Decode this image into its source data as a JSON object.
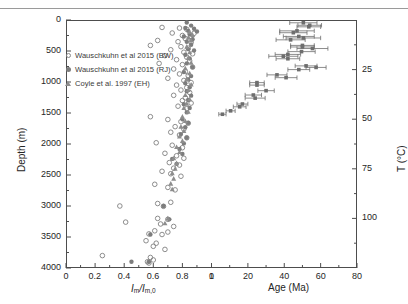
{
  "figure": {
    "background": "#ffffff",
    "frame_color": "#4d4d4d",
    "marker_color": "#808080",
    "errorbar_color": "#6e6e6e"
  },
  "legend": {
    "entries": [
      {
        "marker": "open-circle",
        "label": "Wauschkuhn et al 2015 (BW)"
      },
      {
        "marker": "filled-circle",
        "label": "Wauschkuhn et al 2015 (RJ)"
      },
      {
        "marker": "filled-triangle",
        "label": "Coyle et al. 1997 (EH)"
      }
    ]
  },
  "axes": {
    "left": {
      "label": "Depth (m)",
      "ticks": [
        0,
        500,
        1000,
        1500,
        2000,
        2500,
        3000,
        3500,
        4000
      ],
      "lim": [
        0,
        4000
      ],
      "inverted": true
    },
    "bottom_left": {
      "label_html": "Im/Im,0",
      "ticks": [
        0,
        0.2,
        0.4,
        0.6,
        0.8,
        1
      ],
      "tick_labels": [
        "0",
        "0.2",
        "0.4",
        "0.6",
        "0.8",
        "1"
      ],
      "lim": [
        0,
        1
      ]
    },
    "bottom_right": {
      "label": "Age (Ma)",
      "ticks": [
        0,
        20,
        40,
        60,
        80
      ],
      "tick_labels": [
        "0",
        "20",
        "40",
        "60",
        "80"
      ],
      "lim": [
        0,
        80
      ]
    },
    "right": {
      "label": "T (°C)",
      "ticks": [
        25,
        50,
        75,
        100
      ],
      "tick_labels": [
        "25",
        "50",
        "75",
        "100"
      ],
      "lim": [
        0,
        125
      ]
    }
  },
  "chart_data": {
    "type": "scatter",
    "title": "",
    "xlabel": "Im/Im,0 and Age (Ma)",
    "ylabel": "Depth (m)",
    "ylim": [
      0,
      4000
    ],
    "y_inverted": true,
    "grid": false,
    "legend_position": "upper-left",
    "panels": [
      {
        "name": "track-length-ratio",
        "xlabel": "Im/Im,0",
        "xlim": [
          0,
          1
        ],
        "series": [
          {
            "name": "Wauschkuhn et al 2015 (BW)",
            "marker": "open-circle",
            "color": "#808080",
            "points": [
              [
                0.66,
                120
              ],
              [
                0.78,
                130
              ],
              [
                0.83,
                150
              ],
              [
                0.73,
                210
              ],
              [
                0.88,
                215
              ],
              [
                0.8,
                250
              ],
              [
                0.86,
                265
              ],
              [
                0.82,
                300
              ],
              [
                0.63,
                330
              ],
              [
                0.77,
                350
              ],
              [
                0.86,
                360
              ],
              [
                0.58,
                410
              ],
              [
                0.79,
                430
              ],
              [
                0.84,
                455
              ],
              [
                0.72,
                480
              ],
              [
                0.81,
                520
              ],
              [
                0.87,
                545
              ],
              [
                0.68,
                575
              ],
              [
                0.83,
                600
              ],
              [
                0.76,
                640
              ],
              [
                0.85,
                660
              ],
              [
                0.64,
                700
              ],
              [
                0.8,
                720
              ],
              [
                0.87,
                760
              ],
              [
                0.74,
                790
              ],
              [
                0.82,
                830
              ],
              [
                0.78,
                870
              ],
              [
                0.84,
                900
              ],
              [
                0.7,
                940
              ],
              [
                0.81,
                975
              ],
              [
                0.86,
                1010
              ],
              [
                0.76,
                1050
              ],
              [
                0.83,
                1090
              ],
              [
                0.79,
                1130
              ],
              [
                0.85,
                1170
              ],
              [
                0.74,
                1215
              ],
              [
                0.82,
                1255
              ],
              [
                0.8,
                1300
              ],
              [
                0.86,
                1340
              ],
              [
                0.77,
                1390
              ],
              [
                0.83,
                1430
              ],
              [
                0.58,
                1560
              ],
              [
                0.7,
                1605
              ],
              [
                0.79,
                1640
              ],
              [
                0.84,
                1665
              ],
              [
                0.75,
                1720
              ],
              [
                0.81,
                1760
              ],
              [
                0.72,
                1810
              ],
              [
                0.78,
                1855
              ],
              [
                0.83,
                1900
              ],
              [
                0.62,
                1980
              ],
              [
                0.73,
                2020
              ],
              [
                0.8,
                2060
              ],
              [
                0.68,
                2150
              ],
              [
                0.76,
                2190
              ],
              [
                0.81,
                2230
              ],
              [
                0.71,
                2300
              ],
              [
                0.78,
                2340
              ],
              [
                0.74,
                2390
              ],
              [
                0.66,
                2440
              ],
              [
                0.72,
                2480
              ],
              [
                0.79,
                2520
              ],
              [
                0.61,
                2650
              ],
              [
                0.7,
                2700
              ],
              [
                0.75,
                2740
              ],
              [
                0.37,
                3000
              ],
              [
                0.63,
                2960
              ],
              [
                0.72,
                2940
              ],
              [
                0.67,
                3005
              ],
              [
                0.41,
                3260
              ],
              [
                0.63,
                3200
              ],
              [
                0.7,
                3215
              ],
              [
                0.65,
                3290
              ],
              [
                0.74,
                3330
              ],
              [
                0.61,
                3400
              ],
              [
                0.57,
                3450
              ],
              [
                0.66,
                3460
              ],
              [
                0.7,
                3420
              ],
              [
                0.55,
                3560
              ],
              [
                0.62,
                3600
              ],
              [
                0.6,
                3650
              ],
              [
                0.68,
                3700
              ],
              [
                0.25,
                3800
              ],
              [
                0.58,
                3830
              ],
              [
                0.56,
                3900
              ],
              [
                0.57,
                3920
              ],
              [
                0.6,
                3870
              ]
            ]
          },
          {
            "name": "Wauschkuhn et al 2015 (RJ)",
            "marker": "filled-circle",
            "color": "#7d7d7d",
            "points": [
              [
                0.83,
                40
              ],
              [
                0.86,
                90
              ],
              [
                0.82,
                130
              ],
              [
                0.88,
                140
              ],
              [
                0.84,
                175
              ],
              [
                0.9,
                185
              ],
              [
                0.85,
                230
              ],
              [
                0.81,
                265
              ],
              [
                0.87,
                310
              ],
              [
                0.83,
                350
              ],
              [
                0.86,
                400
              ],
              [
                0.84,
                470
              ],
              [
                0.88,
                490
              ],
              [
                0.82,
                560
              ],
              [
                0.85,
                620
              ],
              [
                0.83,
                700
              ],
              [
                0.87,
                760
              ],
              [
                0.81,
                840
              ],
              [
                0.86,
                905
              ],
              [
                0.84,
                960
              ],
              [
                0.82,
                1020
              ],
              [
                0.85,
                1085
              ],
              [
                0.83,
                1150
              ],
              [
                0.86,
                1220
              ],
              [
                0.84,
                1290
              ],
              [
                0.81,
                1360
              ],
              [
                0.85,
                1420
              ],
              [
                0.83,
                1490
              ],
              [
                0.8,
                1600
              ],
              [
                0.84,
                1660
              ],
              [
                0.82,
                1730
              ],
              [
                0.79,
                1840
              ],
              [
                0.83,
                1900
              ],
              [
                0.81,
                1990
              ],
              [
                0.78,
                2080
              ],
              [
                0.8,
                2160
              ],
              [
                0.73,
                2240
              ],
              [
                0.76,
                2320
              ],
              [
                0.67,
                3000
              ],
              [
                0.71,
                3215
              ],
              [
                0.58,
                3460
              ],
              [
                0.45,
                3900
              ],
              [
                0.57,
                3900
              ]
            ]
          },
          {
            "name": "Coyle et al. 1997 (EH)",
            "marker": "filled-triangle",
            "color": "#8d8d8d",
            "points": [
              [
                0.85,
                195
              ],
              [
                0.87,
                240
              ],
              [
                0.84,
                285
              ],
              [
                0.86,
                330
              ],
              [
                0.83,
                430
              ],
              [
                0.85,
                520
              ],
              [
                0.84,
                610
              ],
              [
                0.86,
                690
              ],
              [
                0.82,
                780
              ],
              [
                0.85,
                860
              ],
              [
                0.83,
                950
              ],
              [
                0.86,
                1040
              ],
              [
                0.84,
                1130
              ],
              [
                0.82,
                1210
              ],
              [
                0.85,
                1280
              ],
              [
                0.83,
                1350
              ],
              [
                0.81,
                1420
              ],
              [
                0.84,
                1480
              ],
              [
                0.8,
                1560
              ],
              [
                0.82,
                1630
              ],
              [
                0.79,
                1720
              ],
              [
                0.81,
                1790
              ],
              [
                0.78,
                1880
              ],
              [
                0.8,
                1950
              ],
              [
                0.76,
                2050
              ],
              [
                0.78,
                2130
              ],
              [
                0.74,
                2230
              ],
              [
                0.76,
                2310
              ],
              [
                0.75,
                2400
              ],
              [
                0.73,
                2470
              ],
              [
                0.74,
                2560
              ],
              [
                0.72,
                2640
              ],
              [
                0.73,
                2730
              ],
              [
                0.7,
                3200
              ],
              [
                0.68,
                3280
              ]
            ]
          }
        ]
      },
      {
        "name": "age-temperature",
        "xlabel": "Age (Ma)",
        "xlim": [
          0,
          80
        ],
        "series": [
          {
            "name": "Age with uncertainty",
            "marker": "filled-square",
            "color": "#6e6e6e",
            "points": [
              {
                "age": 50.5,
                "depth": 45,
                "err": 7.5
              },
              {
                "age": 54.0,
                "depth": 85,
                "err": 6.5
              },
              {
                "age": 53.5,
                "depth": 110,
                "err": 6.5
              },
              {
                "age": 47.0,
                "depth": 175,
                "err": 9.5
              },
              {
                "age": 45.0,
                "depth": 205,
                "err": 7.5
              },
              {
                "age": 48.0,
                "depth": 265,
                "err": 8.5
              },
              {
                "age": 50.5,
                "depth": 290,
                "err": 9.5
              },
              {
                "age": 43.5,
                "depth": 320,
                "err": 8.0
              },
              {
                "age": 50.0,
                "depth": 410,
                "err": 6.5
              },
              {
                "age": 50.0,
                "depth": 435,
                "err": 6.5
              },
              {
                "age": 55.5,
                "depth": 460,
                "err": 8.5
              },
              {
                "age": 49.5,
                "depth": 510,
                "err": 7.5
              },
              {
                "age": 42.0,
                "depth": 555,
                "err": 7.0
              },
              {
                "age": 39.5,
                "depth": 585,
                "err": 8.0
              },
              {
                "age": 42.0,
                "depth": 625,
                "err": 6.5
              },
              {
                "age": 52.0,
                "depth": 740,
                "err": 6.0
              },
              {
                "age": 57.5,
                "depth": 765,
                "err": 5.5
              },
              {
                "age": 48.0,
                "depth": 800,
                "err": 6.0
              },
              {
                "age": 36.0,
                "depth": 885,
                "err": 5.5
              },
              {
                "age": 41.0,
                "depth": 930,
                "err": 6.0
              },
              {
                "age": 25.0,
                "depth": 1010,
                "err": 4.0
              },
              {
                "age": 25.0,
                "depth": 1050,
                "err": 4.0
              },
              {
                "age": 30.0,
                "depth": 1140,
                "err": 4.5
              },
              {
                "age": 23.0,
                "depth": 1210,
                "err": 4.5
              },
              {
                "age": 24.0,
                "depth": 1260,
                "err": 5.5
              },
              {
                "age": 17.0,
                "depth": 1355,
                "err": 3.0
              },
              {
                "age": 15.5,
                "depth": 1400,
                "err": 3.5
              },
              {
                "age": 10.5,
                "depth": 1465,
                "err": 2.5
              },
              {
                "age": 6.0,
                "depth": 1520,
                "err": 2.0
              }
            ]
          }
        ]
      }
    ]
  }
}
